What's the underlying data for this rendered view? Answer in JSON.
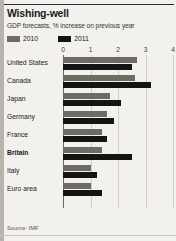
{
  "card": {
    "title": "Wishing-well",
    "subtitle": "GDP forecasts, % increase on previous year",
    "source": "Source: IMF",
    "accent_color": "#b7b3ad",
    "background_color": "#f2f1ee"
  },
  "legend": {
    "position": "top-left",
    "entries": [
      {
        "label": "2010",
        "color": "#6e6b66",
        "swatch_name": "legend-swatch-2010"
      },
      {
        "label": "2011",
        "color": "#141414",
        "swatch_name": "legend-swatch-2011"
      }
    ]
  },
  "chart_data": {
    "type": "bar",
    "orientation": "horizontal",
    "title": "Wishing-well",
    "subtitle": "GDP forecasts, % increase on previous year",
    "xlabel": "",
    "ylabel": "",
    "xlim": [
      0,
      4
    ],
    "xticks": [
      0,
      1,
      2,
      3,
      4
    ],
    "xtick_labels": [
      "0",
      "1",
      "2",
      "3",
      "4"
    ],
    "grid": true,
    "grid_axis": "x",
    "legend_position": "top-left",
    "source": "Source: IMF",
    "highlight_category": "Britain",
    "categories": [
      "United States",
      "Canada",
      "Japan",
      "Germany",
      "France",
      "Britain",
      "Italy",
      "Euro area"
    ],
    "series": [
      {
        "name": "2010",
        "color": "#6e6b66",
        "values": [
          2.7,
          2.6,
          1.7,
          1.6,
          1.4,
          1.4,
          1.0,
          1.0
        ]
      },
      {
        "name": "2011",
        "color": "#141414",
        "values": [
          2.5,
          3.2,
          2.1,
          1.85,
          1.6,
          2.5,
          1.25,
          1.4
        ]
      }
    ]
  }
}
